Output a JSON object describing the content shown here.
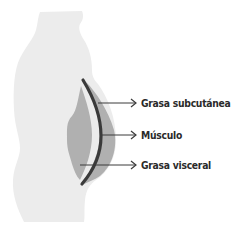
{
  "diagram": {
    "title": "",
    "colors": {
      "body": "#ececec",
      "fat": "#b0b0b0",
      "muscle": "#3a3a3a",
      "pointer": "#3a3a3a",
      "text": "#2a2a2a"
    },
    "labels": [
      {
        "id": "subcutaneous-fat",
        "text": "Grasa subcutánea"
      },
      {
        "id": "muscle",
        "text": "Músculo"
      },
      {
        "id": "visceral-fat",
        "text": "Grasa visceral"
      }
    ]
  }
}
